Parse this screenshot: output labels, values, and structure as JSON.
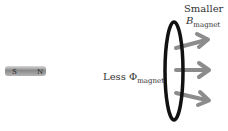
{
  "diagram": {
    "magnet": {
      "south_label": "S",
      "north_label": "N"
    },
    "labels": {
      "smaller": "Smaller",
      "b_symbol": "B",
      "b_subscript": "magnet",
      "less": "Less",
      "phi_symbol": "Φ",
      "phi_subscript": "magnet"
    },
    "field_arrows": 3,
    "colors": {
      "loop": "#111111",
      "arrow": "#8c8c8c",
      "magnet": "#9a9a9a"
    }
  }
}
